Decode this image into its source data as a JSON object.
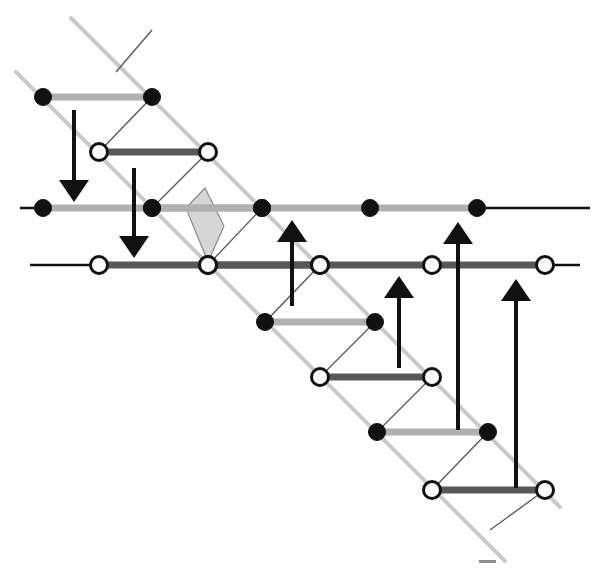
{
  "figure": {
    "width": 605,
    "height": 569,
    "background": "#ffffff"
  },
  "colors": {
    "rail_gray": "#c9c9c9",
    "rung_light_gray": "#b0b0b0",
    "rung_dark_gray": "#585858",
    "node_fill_black": "#111111",
    "node_fill_white": "#ffffff",
    "node_stroke": "#111111",
    "line_black": "#111111",
    "cross_diagonal": "#555555",
    "quad_fill": "#d6d6d6",
    "quad_stroke": "#8a8a8a"
  },
  "geometry": {
    "rail_upper": {
      "x1": 71,
      "y1": 18,
      "x2": 560,
      "y2": 507
    },
    "rail_lower": {
      "x1": 16,
      "y1": 72,
      "x2": 505,
      "y2": 561
    },
    "rail_width": 4
  },
  "main_lines": [
    {
      "name": "upper-horizontal-line",
      "y": 208,
      "x_start": 20,
      "x_end": 590,
      "thick_from": 43,
      "thick_to": 477,
      "thick_color": "#b0b0b0",
      "node_type": "filled",
      "nodes_x": [
        43,
        152,
        262,
        370,
        477
      ]
    },
    {
      "name": "lower-horizontal-line",
      "y": 265,
      "x_start": 30,
      "x_end": 580,
      "thick_from": 99,
      "thick_to": 545,
      "thick_color": "#585858",
      "node_type": "open",
      "nodes_x": [
        99,
        208,
        320,
        432,
        545
      ]
    }
  ],
  "rungs": [
    {
      "name": "rung-1",
      "y": 97,
      "x1": 43,
      "x2": 152,
      "node_type": "filled",
      "color": "#b0b0b0"
    },
    {
      "name": "rung-2",
      "y": 152,
      "x1": 99,
      "x2": 208,
      "node_type": "open",
      "color": "#585858"
    },
    {
      "name": "rung-3",
      "y": 208,
      "x1": 152,
      "x2": 262,
      "node_type": "filled",
      "color": "#b0b0b0"
    },
    {
      "name": "rung-4",
      "y": 265,
      "x1": 208,
      "x2": 320,
      "node_type": "open",
      "color": "#585858"
    },
    {
      "name": "rung-5",
      "y": 322,
      "x1": 265,
      "x2": 375,
      "node_type": "filled",
      "color": "#b0b0b0"
    },
    {
      "name": "rung-6",
      "y": 377,
      "x1": 320,
      "x2": 432,
      "node_type": "open",
      "color": "#585858"
    },
    {
      "name": "rung-7",
      "y": 432,
      "x1": 377,
      "x2": 488,
      "node_type": "filled",
      "color": "#b0b0b0"
    },
    {
      "name": "rung-8",
      "y": 490,
      "x1": 432,
      "x2": 545,
      "node_type": "open",
      "color": "#585858"
    }
  ],
  "cross_diagonals": [
    {
      "name": "cross-1",
      "x1": 99,
      "y1": 152,
      "x2": 152,
      "y2": 97
    },
    {
      "name": "cross-2",
      "x1": 152,
      "y1": 208,
      "x2": 208,
      "y2": 152
    },
    {
      "name": "cross-3",
      "x1": 208,
      "y1": 265,
      "x2": 262,
      "y2": 208
    },
    {
      "name": "cross-4",
      "x1": 265,
      "y1": 322,
      "x2": 320,
      "y2": 265
    },
    {
      "name": "cross-5",
      "x1": 320,
      "y1": 377,
      "x2": 375,
      "y2": 322
    },
    {
      "name": "cross-6",
      "x1": 377,
      "y1": 432,
      "x2": 432,
      "y2": 377
    },
    {
      "name": "cross-7",
      "x1": 432,
      "y1": 490,
      "x2": 488,
      "y2": 432
    },
    {
      "name": "cross-8",
      "x1": 116,
      "y1": 72,
      "x2": 152,
      "y2": 30
    },
    {
      "name": "cross-9",
      "x1": 490,
      "y1": 530,
      "x2": 545,
      "y2": 490
    }
  ],
  "shaded_quad": {
    "name": "shaded-quadrilateral",
    "points": "186,208 205,188 224,226 208,262"
  },
  "arrows_down": [
    {
      "name": "down-arrow-1",
      "x": 74,
      "y_top": 110,
      "y_tip": 202
    },
    {
      "name": "down-arrow-2",
      "x": 134,
      "y_top": 168,
      "y_tip": 258
    }
  ],
  "arrows_up": [
    {
      "name": "up-arrow-1",
      "x": 292,
      "y_tip": 220,
      "y_tail": 306
    },
    {
      "name": "up-arrow-2",
      "x": 399,
      "y_tip": 276,
      "y_tail": 368
    },
    {
      "name": "up-arrow-3",
      "x": 458,
      "y_tip": 222,
      "y_tail": 430
    },
    {
      "name": "up-arrow-4",
      "x": 516,
      "y_tip": 279,
      "y_tail": 488
    }
  ],
  "arrow_style": {
    "shaft_width": 4,
    "head_half_width": 15,
    "head_length": 22
  },
  "footer_mark": {
    "name": "footer-dash-mark",
    "x": 479,
    "y": 560,
    "width": 17,
    "height": 3,
    "color": "#8f8f8f"
  },
  "legend": {
    "filled_node_label": "filled node",
    "open_node_label": "open node",
    "up_arrow_label": "upward arrow",
    "down_arrow_label": "downward arrow"
  }
}
